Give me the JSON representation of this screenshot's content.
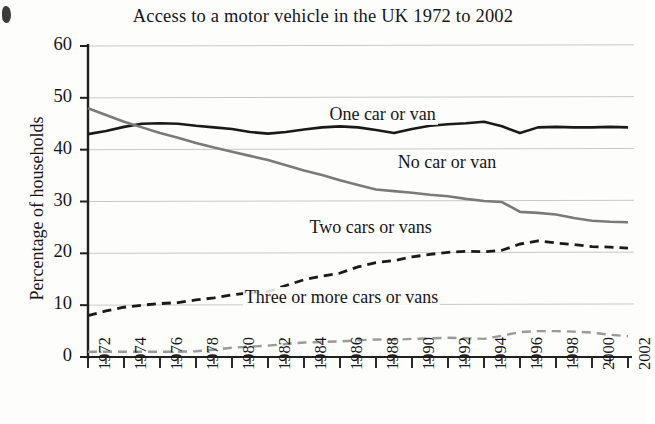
{
  "chart_data": {
    "type": "line",
    "title": "Access to a motor vehicle in the UK 1972 to 2002",
    "xlabel": "",
    "ylabel": "Percentage of households",
    "ylim": [
      0,
      60
    ],
    "yticks": [
      0,
      10,
      20,
      30,
      40,
      50,
      60
    ],
    "ytick_labels": [
      "0",
      "10",
      "20",
      "30",
      "40",
      "50",
      "60"
    ],
    "xlim": [
      1972,
      2002
    ],
    "x": [
      1972,
      1973,
      1974,
      1975,
      1976,
      1977,
      1978,
      1979,
      1980,
      1981,
      1982,
      1983,
      1984,
      1985,
      1986,
      1987,
      1988,
      1989,
      1990,
      1991,
      1992,
      1993,
      1994,
      1995,
      1996,
      1997,
      1998,
      1999,
      2000,
      2001,
      2002
    ],
    "xtick_labels": [
      "1972",
      "1974",
      "1976",
      "1978",
      "1980",
      "1982",
      "1984",
      "1986",
      "1988",
      "1990",
      "1992",
      "1994",
      "1996",
      "1998",
      "2000",
      "2002"
    ],
    "xtick_years": [
      1972,
      1974,
      1976,
      1978,
      1980,
      1982,
      1984,
      1986,
      1988,
      1990,
      1992,
      1994,
      1996,
      1998,
      2000,
      2002
    ],
    "grid": true,
    "grid_axis": "y",
    "legend": "inline-annotations",
    "series": [
      {
        "name": "One car or van",
        "style": "solid",
        "color": "#1a1a1a",
        "width": 2.6,
        "label_x": 1985.3,
        "label_y": 46.6,
        "values": [
          43.0,
          43.6,
          44.4,
          45.0,
          45.1,
          45.0,
          44.6,
          44.3,
          44.0,
          43.4,
          43.1,
          43.4,
          43.9,
          44.3,
          44.5,
          44.3,
          43.8,
          43.2,
          44.0,
          44.6,
          44.9,
          45.1,
          45.4,
          44.5,
          43.2,
          44.3,
          44.4,
          44.3,
          44.3,
          44.4,
          44.3
        ]
      },
      {
        "name": "No car or van",
        "style": "solid",
        "color": "#7a7a7a",
        "width": 2.6,
        "label_x": 1989.1,
        "label_y": 37.5,
        "values": [
          48.0,
          46.7,
          45.4,
          44.3,
          43.2,
          42.3,
          41.3,
          40.4,
          39.6,
          38.8,
          38.0,
          37.0,
          36.0,
          35.1,
          34.1,
          33.2,
          32.3,
          32.0,
          31.7,
          31.3,
          31.0,
          30.5,
          30.1,
          29.9,
          28.0,
          27.8,
          27.5,
          26.8,
          26.3,
          26.1,
          26.0
        ]
      },
      {
        "name": "Two cars or vans",
        "style": "dashed",
        "color": "#1a1a1a",
        "width": 2.8,
        "label_x": 1984.2,
        "label_y": 24.8,
        "values": [
          8.0,
          8.9,
          9.6,
          10.0,
          10.3,
          10.5,
          11.0,
          11.4,
          12.0,
          12.4,
          12.6,
          13.8,
          14.9,
          15.6,
          16.2,
          17.4,
          18.2,
          18.6,
          19.3,
          19.8,
          20.2,
          20.4,
          20.3,
          20.6,
          21.8,
          22.4,
          22.0,
          21.7,
          21.3,
          21.2,
          21.0
        ]
      },
      {
        "name": "Three or more cars or vans",
        "style": "dashed",
        "color": "#9a9a9a",
        "width": 2.4,
        "label_x": 1980.6,
        "label_y": 11.3,
        "values": [
          1.0,
          1.0,
          1.0,
          1.0,
          1.0,
          1.0,
          1.1,
          1.4,
          1.8,
          2.0,
          2.2,
          2.5,
          2.8,
          2.9,
          3.0,
          3.2,
          3.4,
          3.3,
          3.5,
          3.6,
          3.7,
          3.6,
          3.5,
          4.1,
          4.8,
          5.0,
          5.0,
          4.9,
          4.7,
          4.3,
          4.0
        ]
      }
    ]
  }
}
